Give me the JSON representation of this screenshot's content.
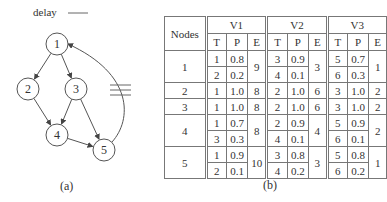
{
  "legend": {
    "label": "delay"
  },
  "graph": {
    "caption": "(a)",
    "nodes": [
      {
        "id": "1",
        "x": 57,
        "y": 44
      },
      {
        "id": "2",
        "x": 28,
        "y": 89
      },
      {
        "id": "3",
        "x": 76,
        "y": 89
      },
      {
        "id": "4",
        "x": 57,
        "y": 135
      },
      {
        "id": "5",
        "x": 104,
        "y": 150
      }
    ],
    "edges": [
      {
        "from": "1",
        "to": "2"
      },
      {
        "from": "1",
        "to": "3"
      },
      {
        "from": "2",
        "to": "4"
      },
      {
        "from": "3",
        "to": "4"
      },
      {
        "from": "3",
        "to": "5"
      },
      {
        "from": "4",
        "to": "5"
      },
      {
        "from": "5",
        "to": "1",
        "delay": true
      }
    ]
  },
  "table": {
    "caption": "(b)",
    "header": {
      "nodes": "Nodes",
      "groups": [
        "V1",
        "V2",
        "V3"
      ],
      "sub": [
        "T",
        "P",
        "E"
      ]
    },
    "rows": [
      {
        "node": "1",
        "v": [
          {
            "tp": [
              [
                "1",
                "0.8"
              ],
              [
                "2",
                "0.2"
              ]
            ],
            "e": "9"
          },
          {
            "tp": [
              [
                "3",
                "0.9"
              ],
              [
                "4",
                "0.1"
              ]
            ],
            "e": "3"
          },
          {
            "tp": [
              [
                "5",
                "0.7"
              ],
              [
                "6",
                "0.3"
              ]
            ],
            "e": "1"
          }
        ]
      },
      {
        "node": "2",
        "v": [
          {
            "tp": [
              [
                "1",
                "1.0"
              ]
            ],
            "e": "8"
          },
          {
            "tp": [
              [
                "2",
                "1.0"
              ]
            ],
            "e": "6"
          },
          {
            "tp": [
              [
                "3",
                "1.0"
              ]
            ],
            "e": "2"
          }
        ]
      },
      {
        "node": "3",
        "v": [
          {
            "tp": [
              [
                "1",
                "1.0"
              ]
            ],
            "e": "8"
          },
          {
            "tp": [
              [
                "2",
                "1.0"
              ]
            ],
            "e": "6"
          },
          {
            "tp": [
              [
                "3",
                "1.0"
              ]
            ],
            "e": "2"
          }
        ]
      },
      {
        "node": "4",
        "v": [
          {
            "tp": [
              [
                "1",
                "0.7"
              ],
              [
                "3",
                "0.3"
              ]
            ],
            "e": "8"
          },
          {
            "tp": [
              [
                "2",
                "0.9"
              ],
              [
                "4",
                "0.1"
              ]
            ],
            "e": "4"
          },
          {
            "tp": [
              [
                "5",
                "0.9"
              ],
              [
                "6",
                "0.1"
              ]
            ],
            "e": "2"
          }
        ]
      },
      {
        "node": "5",
        "v": [
          {
            "tp": [
              [
                "1",
                "0.9"
              ],
              [
                "2",
                "0.1"
              ]
            ],
            "e": "10"
          },
          {
            "tp": [
              [
                "3",
                "0.8"
              ],
              [
                "4",
                "0.2"
              ]
            ],
            "e": "3"
          },
          {
            "tp": [
              [
                "5",
                "0.8"
              ],
              [
                "6",
                "0.2"
              ]
            ],
            "e": "1"
          }
        ]
      }
    ]
  }
}
